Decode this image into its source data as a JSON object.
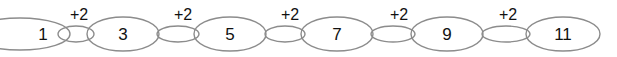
{
  "diagram": {
    "type": "sequence-chain",
    "terms": [
      "1",
      "3",
      "5",
      "7",
      "9",
      "11"
    ],
    "steps": [
      "+2",
      "+2",
      "+2",
      "+2",
      "+2"
    ]
  }
}
